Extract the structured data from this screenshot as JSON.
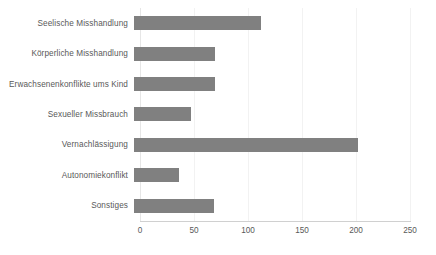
{
  "chart_data": {
    "type": "bar",
    "orientation": "horizontal",
    "title": "",
    "xlabel": "",
    "ylabel": "",
    "xlim": [
      0,
      250
    ],
    "xticks": [
      0,
      50,
      100,
      150,
      200,
      250
    ],
    "grid": true,
    "legend": null,
    "bar_color": "#808080",
    "text_color": "#595959",
    "gridline_color": "#f2f2f2",
    "axis_color": "#d0d0d0",
    "categories": [
      "Seelische Misshandlung",
      "Körperliche Misshandlung",
      "Erwachsenenkonflikte ums Kind",
      "Sexueller Missbrauch",
      "Vernachlässigung",
      "Autonomiekonflikt",
      "Sonstiges"
    ],
    "values": [
      118,
      75,
      75,
      53,
      207,
      42,
      74
    ]
  }
}
